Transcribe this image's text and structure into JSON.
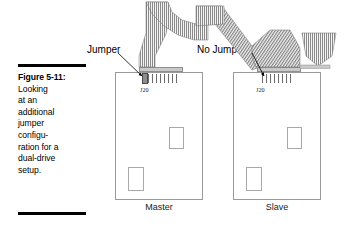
{
  "figure": {
    "label": "Figure 5-11:",
    "caption_lines": [
      "Looking",
      "at an",
      "additional",
      "jumper",
      "configu-",
      "ration for a",
      "dual-drive",
      "setup."
    ],
    "caption_full": "Figure 5-11: Looking at an additional jumper configuration for a dual-drive setup."
  },
  "callouts": {
    "left": "Jumper",
    "right": "No Jumper"
  },
  "drives": [
    {
      "id": "master",
      "label": "Master",
      "connector_label": "J20",
      "jumper_present": true,
      "pin_pairs": 5
    },
    {
      "id": "slave",
      "label": "Slave",
      "connector_label": "J20",
      "jumper_present": false,
      "pin_pairs": 5
    }
  ],
  "cable": {
    "name": "ribbon-cable",
    "description": "IDE ribbon cable routed from upper left across to both drive connectors"
  },
  "colors": {
    "ink": "#000000",
    "outline": "#9a9a9a",
    "cable_light": "#f2f2f2",
    "cable_dark": "#6e6e6e",
    "jumper_fill": "#8d8d8d"
  }
}
